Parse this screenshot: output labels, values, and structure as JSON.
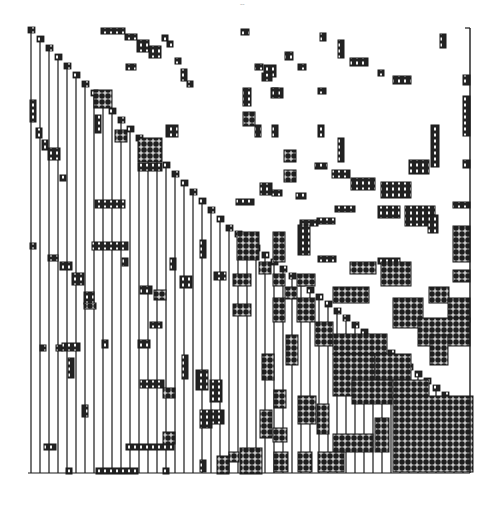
{
  "figure": {
    "page_mark": "-- ",
    "bleed_through_text": "",
    "colors": {
      "ink": "#1a1a1a",
      "paper": "#ffffff",
      "block_fill": "#2a2a2a",
      "grid_light": "#ffffff"
    },
    "frame": {
      "left": 28,
      "top": 28,
      "right": 470,
      "bottom": 473
    },
    "diagonal": {
      "segments": [
        {
          "x0": 28,
          "y0": 28,
          "x1": 228,
          "y1": 232,
          "step": 9
        },
        {
          "x0": 160,
          "y0": 165,
          "x1": 268,
          "y1": 262,
          "step": 9
        }
      ]
    },
    "columns_x": [
      31,
      40,
      49,
      58,
      67,
      76,
      85,
      94,
      103,
      112,
      121,
      130,
      139,
      148,
      157,
      166,
      175,
      184,
      193,
      202,
      211,
      220,
      229,
      238,
      247,
      256,
      265,
      274,
      283,
      292,
      301,
      310,
      319,
      328,
      337,
      346,
      355,
      364,
      373,
      382,
      391,
      400,
      409,
      418,
      427,
      436,
      445,
      454,
      463
    ],
    "blocks": [
      {
        "x": 101,
        "y": 28,
        "w": 24,
        "h": 6,
        "kind": "sparse"
      },
      {
        "x": 125,
        "y": 34,
        "w": 12,
        "h": 6,
        "kind": "sparse"
      },
      {
        "x": 137,
        "y": 40,
        "w": 12,
        "h": 12,
        "kind": "sparse"
      },
      {
        "x": 149,
        "y": 46,
        "w": 12,
        "h": 12,
        "kind": "sparse"
      },
      {
        "x": 162,
        "y": 35,
        "w": 6,
        "h": 6,
        "kind": "sparse"
      },
      {
        "x": 167,
        "y": 41,
        "w": 6,
        "h": 6,
        "kind": "sparse"
      },
      {
        "x": 241,
        "y": 29,
        "w": 8,
        "h": 6,
        "kind": "sparse"
      },
      {
        "x": 126,
        "y": 64,
        "w": 10,
        "h": 6,
        "kind": "sparse"
      },
      {
        "x": 175,
        "y": 58,
        "w": 6,
        "h": 6,
        "kind": "sparse"
      },
      {
        "x": 181,
        "y": 69,
        "w": 6,
        "h": 12,
        "kind": "sparse"
      },
      {
        "x": 187,
        "y": 81,
        "w": 6,
        "h": 6,
        "kind": "sparse"
      },
      {
        "x": 320,
        "y": 33,
        "w": 6,
        "h": 8,
        "kind": "sparse"
      },
      {
        "x": 338,
        "y": 40,
        "w": 6,
        "h": 18,
        "kind": "sparse"
      },
      {
        "x": 350,
        "y": 58,
        "w": 18,
        "h": 8,
        "kind": "sparse"
      },
      {
        "x": 440,
        "y": 34,
        "w": 6,
        "h": 14,
        "kind": "sparse"
      },
      {
        "x": 285,
        "y": 52,
        "w": 8,
        "h": 8,
        "kind": "sparse"
      },
      {
        "x": 264,
        "y": 65,
        "w": 12,
        "h": 12,
        "kind": "sparse"
      },
      {
        "x": 378,
        "y": 70,
        "w": 6,
        "h": 6,
        "kind": "sparse"
      },
      {
        "x": 393,
        "y": 76,
        "w": 18,
        "h": 8,
        "kind": "sparse"
      },
      {
        "x": 255,
        "y": 64,
        "w": 8,
        "h": 6,
        "kind": "sparse"
      },
      {
        "x": 262,
        "y": 73,
        "w": 10,
        "h": 8,
        "kind": "sparse"
      },
      {
        "x": 271,
        "y": 88,
        "w": 12,
        "h": 10,
        "kind": "sparse"
      },
      {
        "x": 318,
        "y": 88,
        "w": 8,
        "h": 6,
        "kind": "sparse"
      },
      {
        "x": 298,
        "y": 64,
        "w": 8,
        "h": 6,
        "kind": "sparse"
      },
      {
        "x": 243,
        "y": 88,
        "w": 8,
        "h": 18,
        "kind": "sparse"
      },
      {
        "x": 243,
        "y": 112,
        "w": 12,
        "h": 14,
        "kind": "dense"
      },
      {
        "x": 272,
        "y": 88,
        "w": 6,
        "h": 8,
        "kind": "sparse"
      },
      {
        "x": 255,
        "y": 125,
        "w": 6,
        "h": 12,
        "kind": "sparse"
      },
      {
        "x": 272,
        "y": 125,
        "w": 6,
        "h": 12,
        "kind": "sparse"
      },
      {
        "x": 318,
        "y": 125,
        "w": 6,
        "h": 12,
        "kind": "sparse"
      },
      {
        "x": 338,
        "y": 138,
        "w": 6,
        "h": 24,
        "kind": "sparse"
      },
      {
        "x": 431,
        "y": 125,
        "w": 8,
        "h": 42,
        "kind": "sparse"
      },
      {
        "x": 409,
        "y": 160,
        "w": 20,
        "h": 14,
        "kind": "sparse"
      },
      {
        "x": 463,
        "y": 75,
        "w": 7,
        "h": 10,
        "kind": "sparse"
      },
      {
        "x": 463,
        "y": 96,
        "w": 7,
        "h": 40,
        "kind": "sparse"
      },
      {
        "x": 463,
        "y": 160,
        "w": 7,
        "h": 8,
        "kind": "sparse"
      },
      {
        "x": 284,
        "y": 150,
        "w": 12,
        "h": 12,
        "kind": "dense"
      },
      {
        "x": 284,
        "y": 170,
        "w": 12,
        "h": 12,
        "kind": "dense"
      },
      {
        "x": 315,
        "y": 163,
        "w": 12,
        "h": 6,
        "kind": "sparse"
      },
      {
        "x": 332,
        "y": 170,
        "w": 18,
        "h": 8,
        "kind": "sparse"
      },
      {
        "x": 351,
        "y": 178,
        "w": 24,
        "h": 12,
        "kind": "sparse"
      },
      {
        "x": 381,
        "y": 182,
        "w": 30,
        "h": 16,
        "kind": "sparse"
      },
      {
        "x": 260,
        "y": 183,
        "w": 12,
        "h": 12,
        "kind": "sparse"
      },
      {
        "x": 296,
        "y": 193,
        "w": 10,
        "h": 6,
        "kind": "sparse"
      },
      {
        "x": 236,
        "y": 199,
        "w": 18,
        "h": 6,
        "kind": "sparse"
      },
      {
        "x": 272,
        "y": 190,
        "w": 10,
        "h": 6,
        "kind": "sparse"
      },
      {
        "x": 378,
        "y": 206,
        "w": 22,
        "h": 12,
        "kind": "sparse"
      },
      {
        "x": 405,
        "y": 206,
        "w": 30,
        "h": 20,
        "kind": "sparse"
      },
      {
        "x": 453,
        "y": 202,
        "w": 17,
        "h": 6,
        "kind": "sparse"
      },
      {
        "x": 335,
        "y": 206,
        "w": 20,
        "h": 6,
        "kind": "sparse"
      },
      {
        "x": 300,
        "y": 220,
        "w": 18,
        "h": 6,
        "kind": "sparse"
      },
      {
        "x": 317,
        "y": 218,
        "w": 18,
        "h": 6,
        "kind": "sparse"
      },
      {
        "x": 298,
        "y": 225,
        "w": 12,
        "h": 30,
        "kind": "sparse"
      },
      {
        "x": 318,
        "y": 256,
        "w": 18,
        "h": 6,
        "kind": "sparse"
      },
      {
        "x": 237,
        "y": 232,
        "w": 22,
        "h": 28,
        "kind": "dense"
      },
      {
        "x": 273,
        "y": 232,
        "w": 12,
        "h": 30,
        "kind": "dense"
      },
      {
        "x": 428,
        "y": 215,
        "w": 10,
        "h": 18,
        "kind": "sparse"
      },
      {
        "x": 453,
        "y": 226,
        "w": 17,
        "h": 36,
        "kind": "dense"
      },
      {
        "x": 378,
        "y": 258,
        "w": 22,
        "h": 6,
        "kind": "sparse"
      },
      {
        "x": 350,
        "y": 262,
        "w": 26,
        "h": 12,
        "kind": "dense"
      },
      {
        "x": 381,
        "y": 262,
        "w": 30,
        "h": 24,
        "kind": "dense"
      },
      {
        "x": 453,
        "y": 270,
        "w": 17,
        "h": 12,
        "kind": "dense"
      },
      {
        "x": 233,
        "y": 274,
        "w": 18,
        "h": 12,
        "kind": "dense"
      },
      {
        "x": 259,
        "y": 262,
        "w": 12,
        "h": 12,
        "kind": "dense"
      },
      {
        "x": 273,
        "y": 274,
        "w": 12,
        "h": 12,
        "kind": "dense"
      },
      {
        "x": 285,
        "y": 287,
        "w": 12,
        "h": 12,
        "kind": "dense"
      },
      {
        "x": 297,
        "y": 274,
        "w": 18,
        "h": 12,
        "kind": "dense"
      },
      {
        "x": 333,
        "y": 287,
        "w": 36,
        "h": 16,
        "kind": "dense"
      },
      {
        "x": 429,
        "y": 287,
        "w": 20,
        "h": 16,
        "kind": "dense"
      },
      {
        "x": 233,
        "y": 304,
        "w": 18,
        "h": 12,
        "kind": "dense"
      },
      {
        "x": 273,
        "y": 298,
        "w": 12,
        "h": 24,
        "kind": "dense"
      },
      {
        "x": 297,
        "y": 298,
        "w": 18,
        "h": 24,
        "kind": "dense"
      },
      {
        "x": 393,
        "y": 298,
        "w": 30,
        "h": 30,
        "kind": "dense"
      },
      {
        "x": 448,
        "y": 298,
        "w": 22,
        "h": 24,
        "kind": "dense"
      },
      {
        "x": 315,
        "y": 322,
        "w": 18,
        "h": 24,
        "kind": "dense"
      },
      {
        "x": 418,
        "y": 318,
        "w": 52,
        "h": 28,
        "kind": "dense"
      },
      {
        "x": 333,
        "y": 334,
        "w": 54,
        "h": 20,
        "kind": "dense"
      },
      {
        "x": 430,
        "y": 335,
        "w": 18,
        "h": 30,
        "kind": "dense"
      },
      {
        "x": 286,
        "y": 335,
        "w": 12,
        "h": 30,
        "kind": "dense"
      },
      {
        "x": 262,
        "y": 354,
        "w": 12,
        "h": 26,
        "kind": "dense"
      },
      {
        "x": 274,
        "y": 390,
        "w": 12,
        "h": 18,
        "kind": "dense"
      },
      {
        "x": 333,
        "y": 354,
        "w": 42,
        "h": 42,
        "kind": "dense"
      },
      {
        "x": 375,
        "y": 354,
        "w": 36,
        "h": 26,
        "kind": "dense"
      },
      {
        "x": 393,
        "y": 380,
        "w": 36,
        "h": 18,
        "kind": "dense"
      },
      {
        "x": 393,
        "y": 396,
        "w": 80,
        "h": 76,
        "kind": "dense"
      },
      {
        "x": 352,
        "y": 380,
        "w": 40,
        "h": 24,
        "kind": "dense"
      },
      {
        "x": 298,
        "y": 396,
        "w": 18,
        "h": 28,
        "kind": "dense"
      },
      {
        "x": 317,
        "y": 404,
        "w": 12,
        "h": 30,
        "kind": "dense"
      },
      {
        "x": 333,
        "y": 434,
        "w": 40,
        "h": 18,
        "kind": "dense"
      },
      {
        "x": 375,
        "y": 418,
        "w": 14,
        "h": 34,
        "kind": "dense"
      },
      {
        "x": 260,
        "y": 410,
        "w": 12,
        "h": 28,
        "kind": "dense"
      },
      {
        "x": 273,
        "y": 428,
        "w": 14,
        "h": 14,
        "kind": "dense"
      },
      {
        "x": 240,
        "y": 448,
        "w": 22,
        "h": 26,
        "kind": "dense"
      },
      {
        "x": 274,
        "y": 452,
        "w": 14,
        "h": 20,
        "kind": "dense"
      },
      {
        "x": 298,
        "y": 452,
        "w": 14,
        "h": 20,
        "kind": "dense"
      },
      {
        "x": 318,
        "y": 452,
        "w": 26,
        "h": 20,
        "kind": "dense"
      },
      {
        "x": 229,
        "y": 452,
        "w": 10,
        "h": 10,
        "kind": "dense"
      },
      {
        "x": 94,
        "y": 90,
        "w": 18,
        "h": 18,
        "kind": "dense"
      },
      {
        "x": 138,
        "y": 138,
        "w": 24,
        "h": 24,
        "kind": "dense"
      },
      {
        "x": 115,
        "y": 130,
        "w": 12,
        "h": 12,
        "kind": "dense"
      },
      {
        "x": 166,
        "y": 125,
        "w": 12,
        "h": 12,
        "kind": "sparse"
      },
      {
        "x": 30,
        "y": 100,
        "w": 6,
        "h": 22,
        "kind": "sparse"
      },
      {
        "x": 36,
        "y": 128,
        "w": 6,
        "h": 10,
        "kind": "sparse"
      },
      {
        "x": 42,
        "y": 140,
        "w": 6,
        "h": 10,
        "kind": "sparse"
      },
      {
        "x": 48,
        "y": 148,
        "w": 12,
        "h": 12,
        "kind": "sparse"
      },
      {
        "x": 60,
        "y": 175,
        "w": 6,
        "h": 6,
        "kind": "sparse"
      },
      {
        "x": 95,
        "y": 115,
        "w": 6,
        "h": 18,
        "kind": "sparse"
      },
      {
        "x": 138,
        "y": 163,
        "w": 24,
        "h": 8,
        "kind": "sparse"
      },
      {
        "x": 95,
        "y": 200,
        "w": 30,
        "h": 8,
        "kind": "sparse"
      },
      {
        "x": 30,
        "y": 243,
        "w": 6,
        "h": 6,
        "kind": "sparse"
      },
      {
        "x": 92,
        "y": 242,
        "w": 36,
        "h": 8,
        "kind": "sparse"
      },
      {
        "x": 72,
        "y": 273,
        "w": 12,
        "h": 12,
        "kind": "sparse"
      },
      {
        "x": 84,
        "y": 292,
        "w": 10,
        "h": 12,
        "kind": "sparse"
      },
      {
        "x": 84,
        "y": 303,
        "w": 12,
        "h": 6,
        "kind": "dense"
      },
      {
        "x": 154,
        "y": 290,
        "w": 12,
        "h": 10,
        "kind": "dense"
      },
      {
        "x": 140,
        "y": 286,
        "w": 12,
        "h": 8,
        "kind": "sparse"
      },
      {
        "x": 150,
        "y": 322,
        "w": 12,
        "h": 6,
        "kind": "sparse"
      },
      {
        "x": 48,
        "y": 255,
        "w": 10,
        "h": 6,
        "kind": "sparse"
      },
      {
        "x": 60,
        "y": 262,
        "w": 12,
        "h": 8,
        "kind": "sparse"
      },
      {
        "x": 122,
        "y": 258,
        "w": 6,
        "h": 8,
        "kind": "sparse"
      },
      {
        "x": 170,
        "y": 258,
        "w": 6,
        "h": 12,
        "kind": "sparse"
      },
      {
        "x": 180,
        "y": 276,
        "w": 12,
        "h": 12,
        "kind": "sparse"
      },
      {
        "x": 200,
        "y": 240,
        "w": 6,
        "h": 18,
        "kind": "sparse"
      },
      {
        "x": 214,
        "y": 272,
        "w": 12,
        "h": 8,
        "kind": "sparse"
      },
      {
        "x": 56,
        "y": 345,
        "w": 6,
        "h": 6,
        "kind": "sparse"
      },
      {
        "x": 40,
        "y": 345,
        "w": 6,
        "h": 6,
        "kind": "sparse"
      },
      {
        "x": 62,
        "y": 343,
        "w": 18,
        "h": 8,
        "kind": "sparse"
      },
      {
        "x": 68,
        "y": 358,
        "w": 6,
        "h": 20,
        "kind": "sparse"
      },
      {
        "x": 138,
        "y": 340,
        "w": 12,
        "h": 8,
        "kind": "sparse"
      },
      {
        "x": 102,
        "y": 340,
        "w": 6,
        "h": 8,
        "kind": "sparse"
      },
      {
        "x": 82,
        "y": 405,
        "w": 6,
        "h": 12,
        "kind": "sparse"
      },
      {
        "x": 140,
        "y": 380,
        "w": 24,
        "h": 8,
        "kind": "sparse"
      },
      {
        "x": 163,
        "y": 388,
        "w": 12,
        "h": 10,
        "kind": "dense"
      },
      {
        "x": 182,
        "y": 355,
        "w": 6,
        "h": 24,
        "kind": "sparse"
      },
      {
        "x": 196,
        "y": 370,
        "w": 12,
        "h": 20,
        "kind": "sparse"
      },
      {
        "x": 210,
        "y": 380,
        "w": 12,
        "h": 22,
        "kind": "sparse"
      },
      {
        "x": 200,
        "y": 410,
        "w": 12,
        "h": 18,
        "kind": "sparse"
      },
      {
        "x": 212,
        "y": 410,
        "w": 12,
        "h": 14,
        "kind": "sparse"
      },
      {
        "x": 44,
        "y": 444,
        "w": 12,
        "h": 6,
        "kind": "sparse"
      },
      {
        "x": 126,
        "y": 444,
        "w": 48,
        "h": 6,
        "kind": "sparse"
      },
      {
        "x": 163,
        "y": 432,
        "w": 12,
        "h": 12,
        "kind": "dense"
      },
      {
        "x": 66,
        "y": 468,
        "w": 6,
        "h": 6,
        "kind": "sparse"
      },
      {
        "x": 96,
        "y": 468,
        "w": 42,
        "h": 6,
        "kind": "sparse"
      },
      {
        "x": 163,
        "y": 468,
        "w": 6,
        "h": 6,
        "kind": "sparse"
      },
      {
        "x": 200,
        "y": 460,
        "w": 6,
        "h": 12,
        "kind": "sparse"
      },
      {
        "x": 217,
        "y": 456,
        "w": 12,
        "h": 18,
        "kind": "dense"
      }
    ]
  }
}
